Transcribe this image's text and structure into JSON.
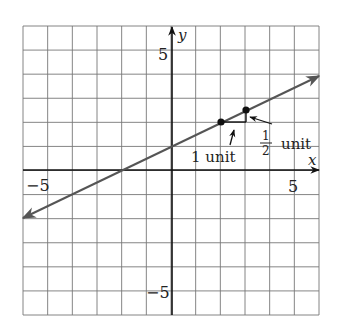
{
  "chart_data": {
    "type": "line",
    "title": "",
    "xlabel": "x",
    "ylabel": "y",
    "xlim": [
      -6,
      6
    ],
    "ylim": [
      -6,
      6
    ],
    "grid": true,
    "tick_labels": {
      "x": [
        "-5",
        "5"
      ],
      "y": [
        "5",
        "-5"
      ]
    },
    "series": [
      {
        "name": "line",
        "equation": "y = 0.5x + 1",
        "slope": 0.5,
        "intercept": 1,
        "x": [
          -6,
          6
        ],
        "y": [
          -2,
          4
        ],
        "arrows_both_ends": true
      }
    ],
    "points": [
      {
        "x": 2,
        "y": 2
      },
      {
        "x": 3,
        "y": 2.5
      }
    ],
    "annotations": [
      {
        "text": "1 unit",
        "target": "horizontal run from (2,2) to (3,2)"
      },
      {
        "text_num": "1",
        "text_den": "2",
        "text_unit": "unit",
        "target": "vertical rise from (3,2) to (3,2.5)"
      }
    ]
  },
  "labels": {
    "x_axis": "x",
    "y_axis": "y",
    "x_neg5": "−5",
    "x_pos5": "5",
    "y_pos5": "5",
    "y_neg5": "−5",
    "run_label": "1 unit",
    "rise_num": "1",
    "rise_den": "2",
    "rise_unit": "unit"
  }
}
